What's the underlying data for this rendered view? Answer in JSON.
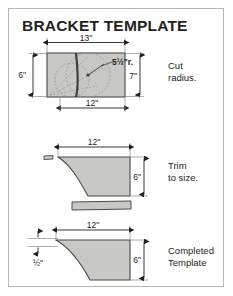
{
  "page": {
    "title": "BRACKET TEMPLATE",
    "background_color": "#ffffff",
    "frame_color": "#b9b6b2",
    "ink_color": "#231f20",
    "fill_color": "#c8c8c5",
    "outline_color": "#4a4a4a",
    "construction_color": "#8e8e8e"
  },
  "steps": [
    {
      "id": "step-1",
      "note": "Cut\nradius.",
      "note_line1": "Cut",
      "note_line2": "radius.",
      "dimensions": {
        "top_width": "13\"",
        "bottom_width": "12\"",
        "left_height": "6\"",
        "right_height": "7\"",
        "radius": "5½\"r."
      }
    },
    {
      "id": "step-2",
      "note_line1": "Trim",
      "note_line2": "to size.",
      "dimensions": {
        "top_width": "12\"",
        "right_height": "6\""
      }
    },
    {
      "id": "step-3",
      "note_line1": "Completed",
      "note_line2": "Template",
      "dimensions": {
        "top_width": "12\"",
        "right_height": "6\"",
        "left_thickness": "½\""
      }
    }
  ]
}
